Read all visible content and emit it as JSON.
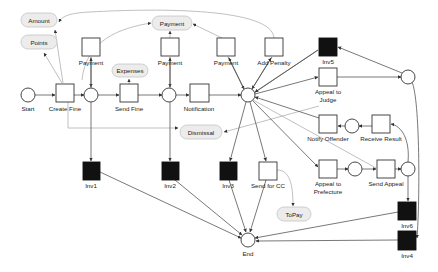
{
  "diagram": {
    "type": "petri-net",
    "colors": {
      "place_stroke": "#333333",
      "transition_stroke": "#333333",
      "invisible_transition_fill": "#111111",
      "data_pill_fill": "#ececec",
      "edge": "#555555",
      "data_edge": "#b0b0b0"
    },
    "places": {
      "start": {
        "label": "Start"
      },
      "end": {
        "label": "End"
      }
    },
    "transitions": {
      "create_fine": "Create Fine",
      "send_fine": "Send Fine",
      "notification": "Notification",
      "payment_1": "Payment",
      "payment_2": "Payment",
      "payment_3": "Payment",
      "add_penalty": "Add Penalty",
      "appeal_to_judge_line1": "Appeal to",
      "appeal_to_judge_line2": "Judge",
      "notify_offender": "Notify Offender",
      "receive_result": "Receive Result",
      "appeal_to_prefecture_line1": "Appeal to",
      "appeal_to_prefecture_line2": "Prefecture",
      "send_appeal": "Send Appeal",
      "send_for_cc": "Send for CC"
    },
    "invisible_transitions": {
      "inv1": "Inv1",
      "inv2": "Inv2",
      "inv3": "Inv3",
      "inv4": "Inv4",
      "inv5": "Inv5",
      "inv6": "Inv6"
    },
    "data_objects": {
      "amount": "Amount",
      "points": "Points",
      "payment": "Payment",
      "expenses": "Expenses",
      "dismissal": "Dismissal",
      "topay": "ToPay"
    }
  }
}
